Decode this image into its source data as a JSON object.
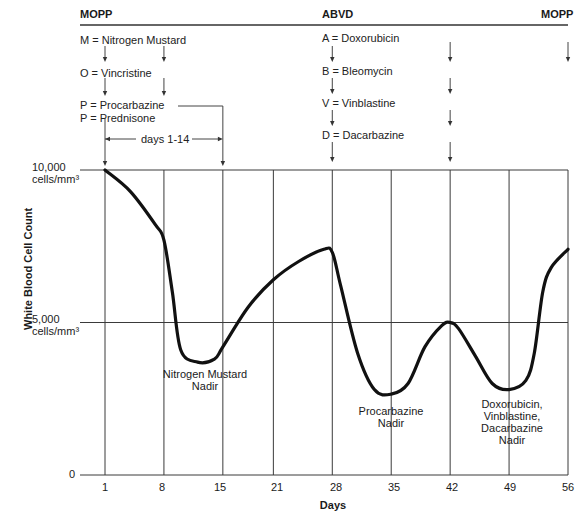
{
  "header": {
    "regimens": [
      {
        "label": "MOPP",
        "x": 80
      },
      {
        "label": "ABVD",
        "x": 322
      },
      {
        "label": "MOPP",
        "x": 541
      }
    ]
  },
  "legend": {
    "mopp": [
      "M = Nitrogen Mustard",
      "O = Vincristine",
      "P = Procarbazine",
      "P = Prednisone"
    ],
    "abvd": [
      "A = Doxorubicin",
      "B = Bleomycin",
      "V = Vinblastine",
      "D = Dacarbazine"
    ],
    "duration_label": "days 1-14"
  },
  "chart_data": {
    "type": "line",
    "title": "",
    "xlabel": "Days",
    "ylabel": "White Blood Cell Count",
    "x_ticks": [
      1,
      8,
      15,
      21,
      28,
      35,
      42,
      49,
      56
    ],
    "y_ticks": [
      {
        "value": 0,
        "label": "0"
      },
      {
        "value": 5000,
        "label": "5,000",
        "unit": "cells/mm³"
      },
      {
        "value": 10000,
        "label": "10,000",
        "unit": "cells/mm³"
      }
    ],
    "ylim": [
      0,
      10000
    ],
    "xlim": [
      1,
      56
    ],
    "grid": true,
    "series": [
      {
        "name": "WBC",
        "x": [
          1,
          4,
          7,
          8,
          9,
          10,
          12,
          14,
          15,
          18,
          21,
          24,
          27,
          28,
          29,
          31,
          33,
          35,
          37,
          39,
          41,
          42,
          43,
          45,
          47,
          49,
          51,
          52,
          53,
          54,
          56
        ],
        "values": [
          10000,
          9300,
          8200,
          7700,
          6000,
          4100,
          3700,
          3800,
          4200,
          5500,
          6400,
          7000,
          7400,
          7300,
          6200,
          4000,
          2800,
          2650,
          3000,
          4200,
          4900,
          5000,
          4800,
          3900,
          3000,
          2800,
          3100,
          4000,
          6000,
          6800,
          7400
        ]
      }
    ],
    "annotations": [
      {
        "text": "Nitrogen Mustard Nadir",
        "lines": [
          "Nitrogen Mustard",
          "Nadir"
        ],
        "x": 12
      },
      {
        "text": "Procarbazine Nadir",
        "lines": [
          "Procarbazine",
          "Nadir"
        ],
        "x": 35
      },
      {
        "text": "Doxorubicin, Vinblastine, Dacarbazine Nadir",
        "lines": [
          "Doxorubicin,",
          "Vinblastine,",
          "Dacarbazine Nadir"
        ],
        "x": 49
      }
    ],
    "dose_arrows_days": [
      1,
      8,
      15,
      28,
      42,
      56
    ]
  }
}
